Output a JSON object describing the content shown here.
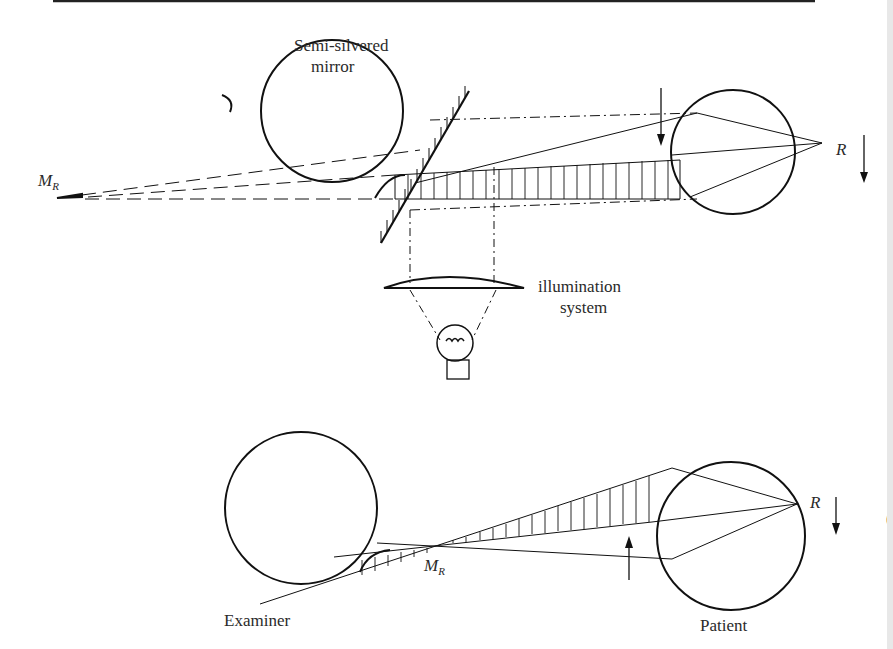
{
  "figure": {
    "top_diagram": {
      "labels": {
        "mirror_line1": "Semi-silvered",
        "mirror_line2": "mirror",
        "illumination_line1": "illumination",
        "illumination_line2": "system",
        "image_point_main": "M",
        "image_point_sub": "R",
        "retina_point": "R"
      }
    },
    "bottom_diagram": {
      "labels": {
        "image_point_main": "M",
        "image_point_sub": "R",
        "retina_point": "R",
        "examiner": "Examiner",
        "patient": "Patient",
        "edge_fragment": "("
      }
    },
    "colors": {
      "ink": "#1a1a1a",
      "paper": "#ffffff"
    }
  }
}
